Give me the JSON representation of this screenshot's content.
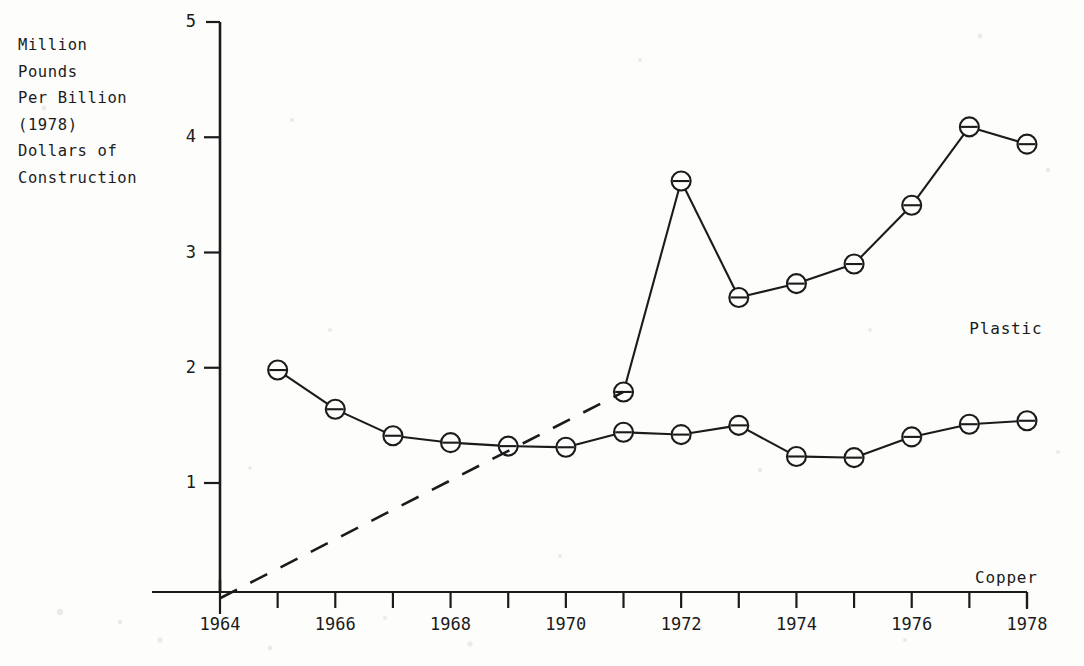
{
  "chart_data": {
    "type": "line",
    "title": "",
    "subtitle": "",
    "xlabel": "",
    "ylabel": "Million\nPounds\nPer Billion\n(1978)\nDollars of\nConstruction",
    "ylabel_lines": [
      "Million",
      "Pounds",
      "Per Billion",
      "(1978)",
      "Dollars of",
      "Construction"
    ],
    "xlim": [
      1964,
      1978
    ],
    "ylim": [
      0,
      5
    ],
    "grid": false,
    "legend_position": "inline-right",
    "x_tick_step": 1,
    "x_tick_labels_every": 2,
    "x_tick_labels": [
      "1964",
      "1966",
      "1968",
      "1970",
      "1972",
      "1974",
      "1976",
      "1978"
    ],
    "x_ticks": [
      1964,
      1965,
      1966,
      1967,
      1968,
      1969,
      1970,
      1971,
      1972,
      1973,
      1974,
      1975,
      1976,
      1977,
      1978
    ],
    "y_tick_labels": [
      "1",
      "2",
      "3",
      "4",
      "5"
    ],
    "y_ticks": [
      1,
      2,
      3,
      4,
      5
    ],
    "marker": "circle-with-horizontal-bar",
    "series": [
      {
        "name": "Plastic",
        "label": "Plastic",
        "style": "solid",
        "x": [
          1971,
          1972,
          1973,
          1974,
          1975,
          1976,
          1977,
          1978
        ],
        "values": [
          1.79,
          3.62,
          2.61,
          2.73,
          2.9,
          3.41,
          4.09,
          3.94
        ]
      },
      {
        "name": "Copper",
        "label": "Copper",
        "style": "solid",
        "x": [
          1965,
          1966,
          1967,
          1968,
          1969,
          1970,
          1971,
          1972,
          1973,
          1974,
          1975,
          1976,
          1977,
          1978
        ],
        "values": [
          1.98,
          1.64,
          1.41,
          1.35,
          1.32,
          1.31,
          1.44,
          1.42,
          1.5,
          1.23,
          1.22,
          1.4,
          1.51,
          1.54
        ]
      },
      {
        "name": "Plastic projection",
        "label": "",
        "style": "dashed",
        "x": [
          1964,
          1971
        ],
        "values": [
          0.0,
          1.79
        ]
      }
    ],
    "annotations": [
      {
        "text": "Plastic",
        "x": 1977.0,
        "y": 2.33
      },
      {
        "text": "Copper",
        "x": 1977.1,
        "y": 0.17
      }
    ],
    "colors": {
      "line": "#1b1b1b",
      "marker_fill": "#fdfdfc",
      "axis": "#1b1b1b",
      "background": "#fdfdfc",
      "text": "#1b1b1b"
    }
  }
}
